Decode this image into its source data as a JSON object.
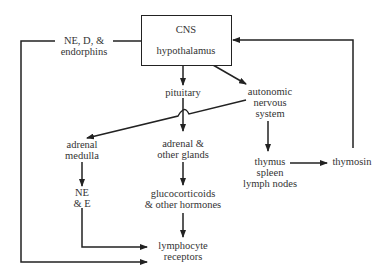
{
  "diagram": {
    "type": "flowchart",
    "colors": {
      "stroke": "#222222",
      "text": "#333333",
      "background": "#ffffff"
    },
    "nodes": {
      "cns": {
        "line1": "CNS",
        "line2": "hypothalamus"
      },
      "ne_d_endorphins": {
        "line1": "NE, D, &",
        "line2": "endorphins"
      },
      "pituitary": {
        "line1": "pituitary"
      },
      "ans": {
        "line1": "autonomic",
        "line2": "nervous",
        "line3": "system"
      },
      "adrenal_medulla": {
        "line1": "adrenal",
        "line2": "medulla"
      },
      "adrenal_glands": {
        "line1": "adrenal &",
        "line2": "other glands"
      },
      "ne_e": {
        "line1": "NE",
        "line2": "& E"
      },
      "glucocorticoids": {
        "line1": "glucocorticoids",
        "line2": "& other hormones"
      },
      "lymphocyte_receptors": {
        "line1": "lymphocyte",
        "line2": "receptors"
      },
      "thymus": {
        "line1": "thymus",
        "line2": "spleen",
        "line3": "lymph nodes"
      },
      "thymosin": {
        "line1": "thymosin"
      }
    },
    "edges": [
      {
        "from": "CNS hypothalamus",
        "to": "pituitary"
      },
      {
        "from": "CNS hypothalamus",
        "to": "autonomic nervous system"
      },
      {
        "from": "CNS hypothalamus",
        "via": "NE, D, & endorphins",
        "to": "lymphocyte receptors"
      },
      {
        "from": "pituitary",
        "to": "adrenal & other glands"
      },
      {
        "from": "autonomic nervous system",
        "to": "adrenal medulla"
      },
      {
        "from": "autonomic nervous system",
        "to": "thymus spleen lymph nodes"
      },
      {
        "from": "adrenal medulla",
        "to": "NE & E"
      },
      {
        "from": "NE & E",
        "to": "lymphocyte receptors"
      },
      {
        "from": "adrenal & other glands",
        "to": "glucocorticoids & other hormones"
      },
      {
        "from": "glucocorticoids & other hormones",
        "to": "lymphocyte receptors"
      },
      {
        "from": "thymus spleen lymph nodes",
        "to": "thymosin"
      },
      {
        "from": "thymosin",
        "to": "CNS hypothalamus"
      }
    ]
  }
}
